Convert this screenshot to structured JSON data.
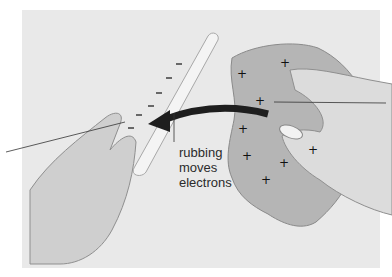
{
  "figure": {
    "caption_label": [
      "rubbing",
      "moves",
      "electrons"
    ],
    "rod_charge_symbol": "−",
    "cloth_charge_symbol": "+",
    "rod_charge_count": 6,
    "cloth_charge_count": 8,
    "colors": {
      "background_panel": "#e9e9e9",
      "cloth": "#b5b5b5",
      "skin": "#dcdcdc",
      "rod": "#f4f4f4",
      "arrow": "#1e1e1e",
      "text": "#2b2b2b"
    }
  }
}
